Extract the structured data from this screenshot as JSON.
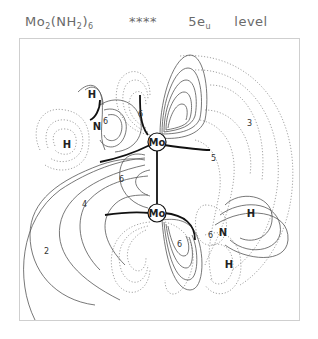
{
  "title": {
    "molecule_main": "Mo",
    "molecule_sub1": "2",
    "molecule_mid": "(NH",
    "molecule_sub2": "2",
    "molecule_close": ")",
    "molecule_sub3": "6",
    "stars": "****",
    "level_main": "5e",
    "level_sub": "u",
    "level_word": "level"
  },
  "atoms": {
    "mo_top": "Mo",
    "mo_bottom": "Mo",
    "n_left": "N",
    "n_right": "N",
    "h_left_top": "H",
    "h_left_bottom": "H",
    "h_right_top": "H",
    "h_right_bottom": "H"
  },
  "contour_labels": {
    "c2": "2",
    "c3": "3",
    "c4": "4",
    "c5": "5",
    "c6_nleft": "6",
    "c6_upper": "6",
    "c6_center": "6",
    "c6_lower": "6",
    "c6_nright": "6"
  },
  "colors": {
    "solid_line": "#555555",
    "dotted_line": "#9a9a9a",
    "node_line": "#111111",
    "frame": "#cfcfcf",
    "title": "#6a6a6a"
  }
}
